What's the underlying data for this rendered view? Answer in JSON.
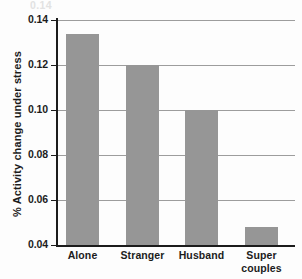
{
  "chart_data": {
    "type": "bar",
    "title": "",
    "subtitle": "",
    "xlabel": "",
    "ylabel": "% Activity change under stress",
    "categories": [
      "Alone",
      "Stranger",
      "Husband",
      "Super couples"
    ],
    "category_lines": [
      [
        "Alone"
      ],
      [
        "Stranger"
      ],
      [
        "Husband"
      ],
      [
        "Super",
        "couples"
      ]
    ],
    "values": [
      0.134,
      0.12,
      0.1,
      0.048
    ],
    "ylim": [
      0.04,
      0.14
    ],
    "ytick_labels": [
      "0.04",
      "0.06",
      "0.08",
      "0.10",
      "0.12",
      "0.14"
    ],
    "ytick_values": [
      0.04,
      0.06,
      0.08,
      0.1,
      0.12,
      0.14
    ],
    "grid": true,
    "grid_axis": "y",
    "legend": false,
    "legend_position": "none",
    "bar_color": "#969696",
    "grid_color": "#9d9d9d",
    "axis_color": "#1c1c1c",
    "background_color": "#fdfdfd"
  },
  "artifact": {
    "top_clipped_text": "0.14"
  }
}
